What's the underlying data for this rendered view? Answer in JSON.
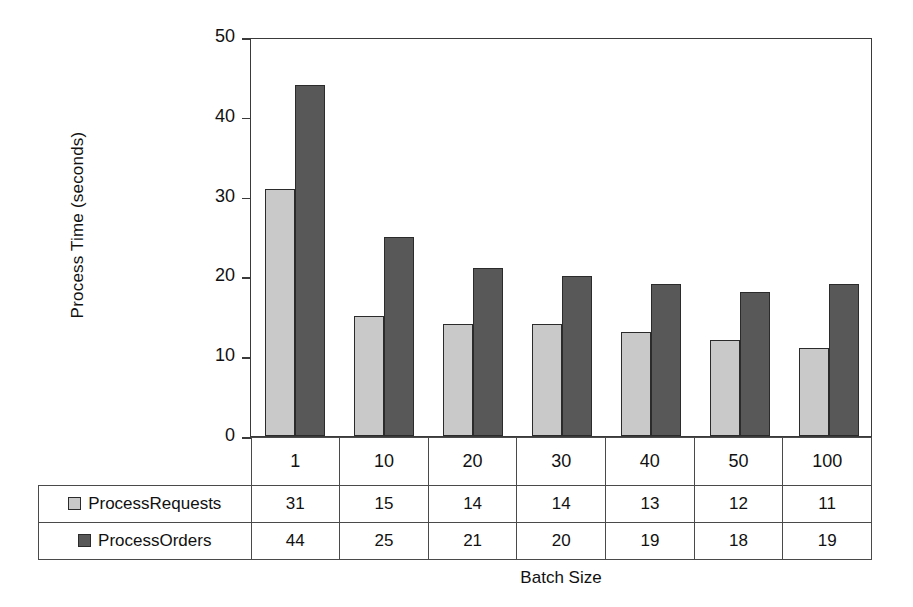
{
  "chart_data": {
    "type": "bar",
    "title": "",
    "xlabel": "Batch Size",
    "ylabel": "Process Time (seconds)",
    "categories": [
      "1",
      "10",
      "20",
      "30",
      "40",
      "50",
      "100"
    ],
    "series": [
      {
        "name": "ProcessRequests",
        "color": "#c9c9c9",
        "values": [
          31,
          15,
          14,
          14,
          13,
          12,
          11
        ]
      },
      {
        "name": "ProcessOrders",
        "color": "#585858",
        "values": [
          44,
          25,
          21,
          20,
          19,
          18,
          19
        ]
      }
    ],
    "ylim": [
      0,
      50
    ],
    "yticks": [
      0,
      10,
      20,
      30,
      40,
      50
    ],
    "ytick_labels": [
      "0",
      "10",
      "20",
      "30",
      "40",
      "50"
    ],
    "grid": false,
    "legend_position": "data-table-left",
    "data_table_visible": true
  },
  "axes": {
    "y_title": "Process Time (seconds)",
    "x_title": "Batch Size"
  },
  "table": {
    "category_header_row": [
      "1",
      "10",
      "20",
      "30",
      "40",
      "50",
      "100"
    ],
    "rows": [
      {
        "label": "ProcessRequests",
        "swatch": "light-gray-swatch",
        "values": [
          "31",
          "15",
          "14",
          "14",
          "13",
          "12",
          "11"
        ]
      },
      {
        "label": "ProcessOrders",
        "swatch": "dark-gray-swatch",
        "values": [
          "44",
          "25",
          "21",
          "20",
          "19",
          "18",
          "19"
        ]
      }
    ]
  },
  "colors": {
    "series_1": "#c9c9c9",
    "series_2": "#585858",
    "axis": "#3a3a3a",
    "background": "#ffffff"
  }
}
